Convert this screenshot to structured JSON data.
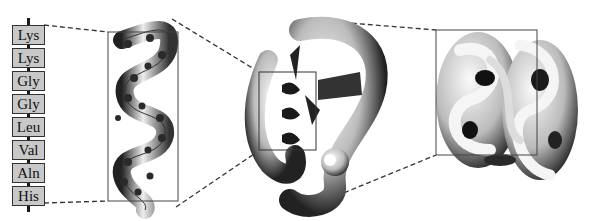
{
  "diagram": {
    "primary_structure": {
      "residues": [
        "Lys",
        "Lys",
        "Gly",
        "Gly",
        "Leu",
        "Val",
        "Aln",
        "His"
      ]
    },
    "panels": [
      {
        "name": "secondary-structure-alpha-helix"
      },
      {
        "name": "tertiary-structure"
      },
      {
        "name": "quaternary-structure"
      }
    ],
    "colors": {
      "box_fill": "#c8c8c8",
      "line": "#333333",
      "ribbon_dark": "#1a1a1a",
      "ribbon_light": "#e8e8e8"
    }
  }
}
